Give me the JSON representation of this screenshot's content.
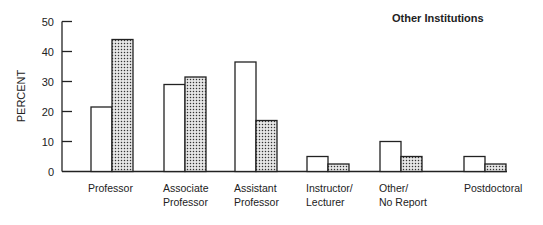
{
  "chart_data": {
    "type": "bar",
    "title": "Other Institutions",
    "xlabel": "",
    "ylabel": "PERCENT",
    "ylim": [
      0,
      50
    ],
    "yticks": [
      0,
      10,
      20,
      30,
      40,
      50
    ],
    "grid": false,
    "legend": "none",
    "categories": [
      "Professor",
      "Associate Professor",
      "Assistant Professor",
      "Instructor/ Lecturer",
      "Other/ No Report",
      "Postdoctoral"
    ],
    "category_lines": [
      [
        "Professor"
      ],
      [
        "Associate",
        "Professor"
      ],
      [
        "Assistant",
        "Professor"
      ],
      [
        "Instructor/",
        "Lecturer"
      ],
      [
        "Other/",
        "No Report"
      ],
      [
        "Postdoctoral"
      ]
    ],
    "series": [
      {
        "name": "open bars",
        "fill": "#ffffff",
        "values": [
          21.5,
          29,
          36.5,
          5,
          10,
          5
        ]
      },
      {
        "name": "dotted bars",
        "fill": "dotted",
        "values": [
          44,
          31.5,
          17,
          2.5,
          5,
          2.5
        ]
      }
    ]
  },
  "colors": {
    "ink": "#222222",
    "background": "#ffffff"
  }
}
